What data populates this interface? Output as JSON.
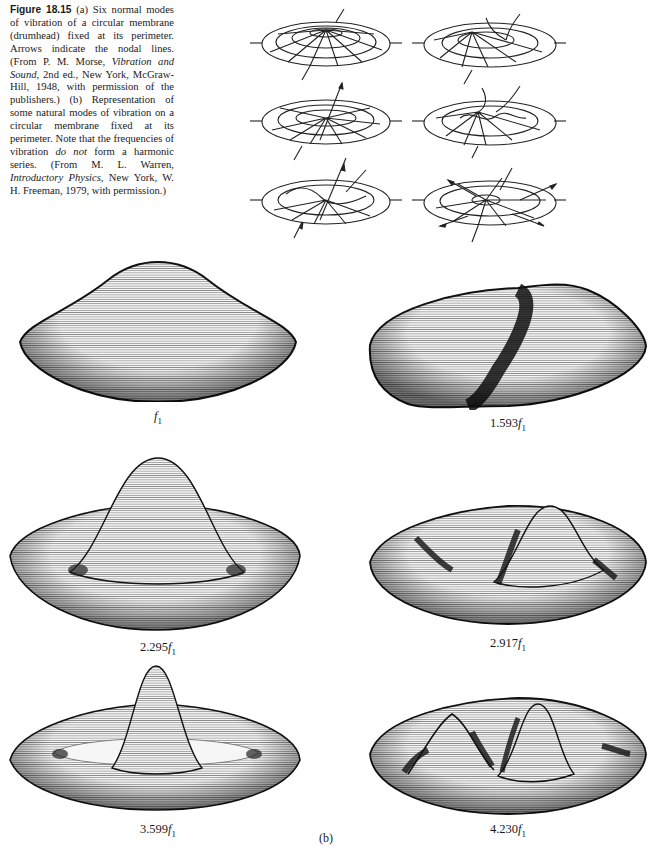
{
  "caption": {
    "figure_label": "Figure 18.15",
    "part_a": "(a) Six normal modes of vibration of a circular membrane (drumhead) fixed at its perimeter. Arrows indicate the nodal lines. (From P. M. Morse, ",
    "part_a_book": "Vibration and Sound",
    "part_a_tail": ", 2nd ed., New York, McGraw-Hill, 1948, with permission of the publishers.)",
    "part_b": "(b) Representation of some natural modes of vibration on a circular membrane fixed at its perimeter. Note that the frequencies of vibration ",
    "part_b_emph": "do not",
    "part_b_mid": " form a harmonic series. (From M. L. Warren, ",
    "part_b_book": "Introductory Physics",
    "part_b_tail": ", New York, W. H. Freeman, 1979, with permission.)"
  },
  "panel_a": {
    "label": "(a)",
    "diagrams": [
      {
        "name": "mode-01-nodal-diagram",
        "nodal_lines": "none (rim only)"
      },
      {
        "name": "mode-02-nodal-diagram",
        "nodal_lines": "one diameter"
      },
      {
        "name": "mode-11-nodal-diagram",
        "nodal_lines": "one circle"
      },
      {
        "name": "mode-21-nodal-diagram",
        "nodal_lines": "two diameters"
      },
      {
        "name": "mode-12-nodal-diagram",
        "nodal_lines": "diameter and circle"
      },
      {
        "name": "mode-31-nodal-diagram",
        "nodal_lines": "three diameters"
      }
    ]
  },
  "panel_b": {
    "label": "(b)",
    "modes": [
      {
        "multiplier": "",
        "symbol": "f",
        "subscript": "1"
      },
      {
        "multiplier": "1.593",
        "symbol": "f",
        "subscript": "1"
      },
      {
        "multiplier": "2.295",
        "symbol": "f",
        "subscript": "1"
      },
      {
        "multiplier": "2.917",
        "symbol": "f",
        "subscript": "1"
      },
      {
        "multiplier": "3.599",
        "symbol": "f",
        "subscript": "1"
      },
      {
        "multiplier": "4.230",
        "symbol": "f",
        "subscript": "1"
      }
    ]
  }
}
